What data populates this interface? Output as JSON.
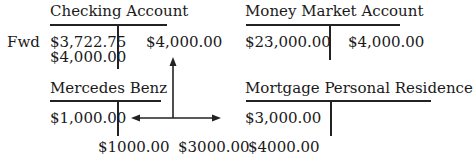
{
  "row_label": "Fwd",
  "accounts": [
    {
      "name": "Checking Account",
      "debits": [
        "$3,722.75",
        "$4,000.00"
      ],
      "credits": [
        "$4,000.00"
      ]
    },
    {
      "name": "Money Market Account",
      "debits": [
        "$23,000.00"
      ],
      "credits": [
        "$4,000.00"
      ]
    },
    {
      "name": "Mercedes Benz",
      "debits": [
        "$1,000.00"
      ],
      "credits": []
    },
    {
      "name": "Mortgage Personal Residence",
      "debits": [
        "$3,000.00"
      ],
      "credits": []
    }
  ],
  "footer_amounts": [
    "$1000.00",
    "$3000.00",
    "$4000.00"
  ]
}
